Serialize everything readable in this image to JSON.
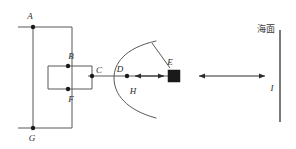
{
  "figure": {
    "background_color": "#ffffff",
    "line_color": "#595959",
    "node_color": "#1a1a1a",
    "label_color": "#2b2b2b",
    "width": 296,
    "height": 149
  },
  "labels": {
    "A": "A",
    "B": "B",
    "C": "C",
    "D": "D",
    "E": "E",
    "F": "F",
    "G": "G",
    "H": "H",
    "I": "I",
    "sea_surface": "海面"
  },
  "nodes": [
    {
      "id": "A",
      "label": "A",
      "x": 33,
      "y": 27
    },
    {
      "id": "B",
      "label": "B",
      "x": 68,
      "y": 66
    },
    {
      "id": "C",
      "label": "C",
      "x": 88,
      "y": 76
    },
    {
      "id": "D",
      "label": "D",
      "x": 127,
      "y": 76
    },
    {
      "id": "F",
      "label": "F",
      "x": 68,
      "y": 89
    },
    {
      "id": "G",
      "label": "G",
      "x": 33,
      "y": 128
    }
  ],
  "block": {
    "id": "E",
    "label": "E",
    "x": 168,
    "y": 70,
    "width": 12,
    "height": 12,
    "color": "#1a1a1a"
  },
  "arrows": [
    {
      "id": "arrow-D-E",
      "from_x": 134,
      "to_x": 165,
      "y": 76,
      "double_headed": true
    },
    {
      "id": "arrow-E-I",
      "from_x": 198,
      "to_x": 266,
      "y": 76,
      "double_headed": true
    }
  ],
  "sea_surface_line": {
    "x": 280,
    "y_top": 30,
    "y_bottom": 122
  },
  "arc": {
    "label": "H",
    "cx": 130,
    "cy": 76,
    "rx": 18,
    "ry": 40
  }
}
